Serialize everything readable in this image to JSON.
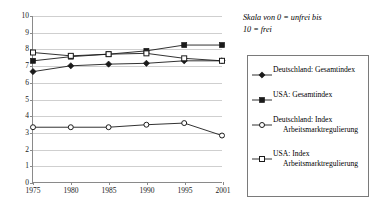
{
  "note": {
    "line1": "Skala von 0 = unfrei bis",
    "line2": "10 = frei"
  },
  "legend": {
    "items": [
      {
        "marker": "filled-diamond-marker",
        "label": "Deutschland: Gesamtindex",
        "label_line2": ""
      },
      {
        "marker": "filled-square-marker",
        "label": "USA: Gesamtindex",
        "label_line2": ""
      },
      {
        "marker": "open-circle-marker",
        "label": "Deutschland: Index",
        "label_line2": "Arbeitsmarktregulierung"
      },
      {
        "marker": "open-square-marker",
        "label": "USA: Index",
        "label_line2": "Arbeitsmarktregulierung"
      }
    ]
  },
  "chart_data": {
    "type": "line",
    "title": "",
    "xlabel": "",
    "ylabel": "",
    "x": [
      "1975",
      "1980",
      "1985",
      "1990",
      "1995",
      "2001"
    ],
    "xlim": [
      0,
      5
    ],
    "ylim": [
      0,
      10
    ],
    "yticks": [
      "0",
      "1",
      "2",
      "3",
      "4",
      "5",
      "6",
      "7",
      "8",
      "9",
      "10"
    ],
    "grid": "horizontal",
    "legend_position": "right",
    "annotation": "Skala von 0 = unfrei bis 10 = frei",
    "series": [
      {
        "name": "Deutschland: Gesamtindex",
        "marker": "filled-diamond",
        "color": "#1a1a1a",
        "values": [
          6.65,
          7.0,
          7.1,
          7.15,
          7.3,
          7.3
        ]
      },
      {
        "name": "USA: Gesamtindex",
        "marker": "filled-square",
        "color": "#1a1a1a",
        "values": [
          7.3,
          7.55,
          7.7,
          7.9,
          8.25,
          8.25
        ]
      },
      {
        "name": "Deutschland: Index Arbeitsmarktregulierung",
        "marker": "open-circle",
        "color": "#1a1a1a",
        "values": [
          3.3,
          3.3,
          3.3,
          3.45,
          3.55,
          2.8
        ]
      },
      {
        "name": "USA: Index Arbeitsmarktregulierung",
        "marker": "open-square",
        "color": "#1a1a1a",
        "values": [
          7.8,
          7.6,
          7.7,
          7.75,
          7.45,
          7.3
        ]
      }
    ]
  }
}
